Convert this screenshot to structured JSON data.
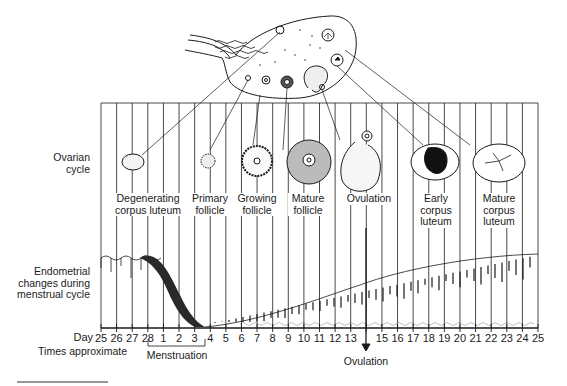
{
  "row_labels": {
    "ovarian": [
      "Ovarian",
      "cycle"
    ],
    "endometrial": [
      "Endometrial",
      "changes during",
      "menstrual cycle"
    ]
  },
  "stages": [
    {
      "id": "degenerating-corpus-luteum",
      "lines": [
        "Degenerating",
        "corpus luteum"
      ]
    },
    {
      "id": "primary-follicle",
      "lines": [
        "Primary",
        "follicle"
      ]
    },
    {
      "id": "growing-follicle",
      "lines": [
        "Growing",
        "follicle"
      ]
    },
    {
      "id": "mature-follicle",
      "lines": [
        "Mature",
        "follicle"
      ]
    },
    {
      "id": "ovulation",
      "lines": [
        "Ovulation"
      ]
    },
    {
      "id": "early-corpus-luteum",
      "lines": [
        "Early",
        "corpus",
        "luteum"
      ]
    },
    {
      "id": "mature-corpus-luteum",
      "lines": [
        "Mature",
        "corpus",
        "luteum"
      ]
    }
  ],
  "axis": {
    "day_label": "Day",
    "days": [
      "25",
      "26",
      "27",
      "28",
      "1",
      "2",
      "3",
      "4",
      "5",
      "6",
      "7",
      "8",
      "9",
      "10",
      "11",
      "12",
      "13",
      "",
      "15",
      "16",
      "17",
      "18",
      "19",
      "20",
      "21",
      "22",
      "23",
      "24",
      "25"
    ],
    "note": "Times approximate",
    "menstruation_label": "Menstruation",
    "ovulation_label": "Ovulation"
  },
  "colors": {
    "ink": "#1a1a1a",
    "menstrual_flow": "#2a2a2a",
    "background": "#ffffff"
  }
}
